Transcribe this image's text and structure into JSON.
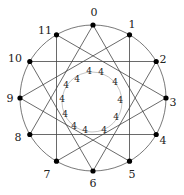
{
  "diagram": {
    "type": "circular-graph",
    "center": [
      93,
      98
    ],
    "radius": 73,
    "inner_circle": {
      "center": [
        92,
        102
      ],
      "radius": 30
    },
    "colors": {
      "line": "#444444",
      "vertex": "#000000",
      "text": "#222222",
      "background": "#ffffff"
    },
    "vertices": [
      {
        "id": "0",
        "x": 93,
        "y": 25,
        "lx": 94,
        "ly": 16
      },
      {
        "id": "1",
        "x": 129.5,
        "y": 34.8,
        "lx": 132,
        "ly": 28
      },
      {
        "id": "2",
        "x": 156.2,
        "y": 61.5,
        "lx": 163,
        "ly": 63
      },
      {
        "id": "3",
        "x": 166,
        "y": 98,
        "lx": 173,
        "ly": 106
      },
      {
        "id": "4",
        "x": 156.2,
        "y": 134.5,
        "lx": 163,
        "ly": 144
      },
      {
        "id": "5",
        "x": 129.5,
        "y": 161.2,
        "lx": 132,
        "ly": 178
      },
      {
        "id": "6",
        "x": 93,
        "y": 171,
        "lx": 93,
        "ly": 187
      },
      {
        "id": "7",
        "x": 56.5,
        "y": 161.2,
        "lx": 47,
        "ly": 178
      },
      {
        "id": "8",
        "x": 29.8,
        "y": 134.5,
        "lx": 18,
        "ly": 141
      },
      {
        "id": "9",
        "x": 20,
        "y": 98,
        "lx": 10,
        "ly": 102
      },
      {
        "id": "10",
        "x": 29.8,
        "y": 61.5,
        "lx": 15,
        "ly": 62
      },
      {
        "id": "11",
        "x": 56.5,
        "y": 34.8,
        "lx": 45,
        "ly": 34
      }
    ],
    "edges": [
      [
        "0",
        "4"
      ],
      [
        "4",
        "8"
      ],
      [
        "8",
        "0"
      ],
      [
        "1",
        "5"
      ],
      [
        "5",
        "9"
      ],
      [
        "9",
        "1"
      ],
      [
        "2",
        "6"
      ],
      [
        "6",
        "10"
      ],
      [
        "10",
        "2"
      ],
      [
        "3",
        "7"
      ],
      [
        "7",
        "11"
      ],
      [
        "11",
        "3"
      ]
    ],
    "inner_labels": [
      {
        "text": "4",
        "x": 77,
        "y": 82
      },
      {
        "text": "4",
        "x": 89,
        "y": 74
      },
      {
        "text": "4",
        "x": 101,
        "y": 75
      },
      {
        "text": "4",
        "x": 115,
        "y": 85
      },
      {
        "text": "4",
        "x": 120,
        "y": 103
      },
      {
        "text": "4",
        "x": 116,
        "y": 120
      },
      {
        "text": "4",
        "x": 104,
        "y": 133
      },
      {
        "text": "4",
        "x": 85,
        "y": 133
      },
      {
        "text": "4",
        "x": 74,
        "y": 129
      },
      {
        "text": "4",
        "x": 65,
        "y": 117
      },
      {
        "text": "4",
        "x": 62,
        "y": 102
      },
      {
        "text": "4",
        "x": 66,
        "y": 88
      }
    ]
  }
}
